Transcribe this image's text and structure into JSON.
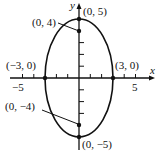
{
  "diagram": {
    "type": "ellipse-graph",
    "axes": {
      "x_label": "x",
      "y_label": "y",
      "x_ticks": [
        "-5",
        "5"
      ]
    },
    "points": {
      "top_vertex": "(0, 5)",
      "bottom_vertex": "(0, −5)",
      "left_intercept": "(−3, 0)",
      "right_intercept": "(3, 0)",
      "upper_focus": "(0, 4)",
      "lower_focus": "(0, −4)"
    },
    "tick_labels": {
      "neg5": "−5",
      "pos5": "5"
    },
    "colors": {
      "ink": "#111111",
      "background": "#ffffff"
    }
  }
}
